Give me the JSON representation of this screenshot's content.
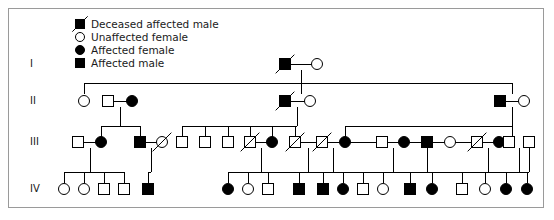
{
  "figure": {
    "kind": "pedigree-chart",
    "width": 554,
    "height": 220,
    "border_color": "#9a9a9a",
    "background_color": "#ffffff",
    "line_color": "#000000",
    "symbol_fill_affected": "#000000",
    "symbol_fill_unaffected": "#ffffff",
    "symbol_stroke": "#000000"
  },
  "legend": {
    "items": [
      {
        "label": "Deceased affected male",
        "shape": "square",
        "affected": true,
        "deceased": true
      },
      {
        "label": "Unaffected female",
        "shape": "circle",
        "affected": false,
        "deceased": false
      },
      {
        "label": "Affected female",
        "shape": "circle",
        "affected": true,
        "deceased": false
      },
      {
        "label": "Affected male",
        "shape": "square",
        "affected": true,
        "deceased": false
      }
    ]
  },
  "generations": [
    {
      "id": "I",
      "label": "I",
      "y": 64
    },
    {
      "id": "II",
      "label": "II",
      "y": 101
    },
    {
      "id": "III",
      "label": "III",
      "y": 142
    },
    {
      "id": "IV",
      "label": "IV",
      "y": 189
    }
  ],
  "individuals": [
    {
      "id": "I-1",
      "gen": "I",
      "x": 285,
      "y": 64,
      "shape": "square",
      "affected": true,
      "deceased": true
    },
    {
      "id": "I-2",
      "gen": "I",
      "x": 317,
      "y": 64,
      "shape": "circle",
      "affected": false,
      "deceased": false
    },
    {
      "id": "II-1",
      "gen": "II",
      "x": 84,
      "y": 101,
      "shape": "circle",
      "affected": false,
      "deceased": false
    },
    {
      "id": "II-2",
      "gen": "II",
      "x": 108,
      "y": 101,
      "shape": "square",
      "affected": false,
      "deceased": false
    },
    {
      "id": "II-3",
      "gen": "II",
      "x": 132,
      "y": 101,
      "shape": "circle",
      "affected": true,
      "deceased": false
    },
    {
      "id": "II-4",
      "gen": "II",
      "x": 285,
      "y": 101,
      "shape": "square",
      "affected": true,
      "deceased": true
    },
    {
      "id": "II-5",
      "gen": "II",
      "x": 310,
      "y": 101,
      "shape": "circle",
      "affected": false,
      "deceased": false
    },
    {
      "id": "II-6",
      "gen": "II",
      "x": 500,
      "y": 101,
      "shape": "square",
      "affected": true,
      "deceased": false
    },
    {
      "id": "II-7",
      "gen": "II",
      "x": 524,
      "y": 101,
      "shape": "circle",
      "affected": false,
      "deceased": false
    },
    {
      "id": "III-1",
      "gen": "III",
      "x": 78,
      "y": 142,
      "shape": "square",
      "affected": false,
      "deceased": false
    },
    {
      "id": "III-2",
      "gen": "III",
      "x": 101,
      "y": 142,
      "shape": "circle",
      "affected": true,
      "deceased": false
    },
    {
      "id": "III-3",
      "gen": "III",
      "x": 140,
      "y": 142,
      "shape": "square",
      "affected": true,
      "deceased": false
    },
    {
      "id": "III-4",
      "gen": "III",
      "x": 162,
      "y": 142,
      "shape": "circle",
      "affected": false,
      "deceased": true
    },
    {
      "id": "III-5",
      "gen": "III",
      "x": 182,
      "y": 142,
      "shape": "square",
      "affected": false,
      "deceased": false
    },
    {
      "id": "III-6",
      "gen": "III",
      "x": 205,
      "y": 142,
      "shape": "square",
      "affected": false,
      "deceased": false
    },
    {
      "id": "III-7",
      "gen": "III",
      "x": 228,
      "y": 142,
      "shape": "square",
      "affected": false,
      "deceased": false
    },
    {
      "id": "III-8",
      "gen": "III",
      "x": 250,
      "y": 142,
      "shape": "square",
      "affected": false,
      "deceased": true
    },
    {
      "id": "III-9",
      "gen": "III",
      "x": 272,
      "y": 142,
      "shape": "circle",
      "affected": true,
      "deceased": false
    },
    {
      "id": "III-10",
      "gen": "III",
      "x": 295,
      "y": 142,
      "shape": "square",
      "affected": false,
      "deceased": true
    },
    {
      "id": "III-11",
      "gen": "III",
      "x": 322,
      "y": 142,
      "shape": "square",
      "affected": false,
      "deceased": true
    },
    {
      "id": "III-12",
      "gen": "III",
      "x": 345,
      "y": 142,
      "shape": "circle",
      "affected": true,
      "deceased": false
    },
    {
      "id": "III-13",
      "gen": "III",
      "x": 382,
      "y": 142,
      "shape": "square",
      "affected": false,
      "deceased": false
    },
    {
      "id": "III-14",
      "gen": "III",
      "x": 404,
      "y": 142,
      "shape": "circle",
      "affected": true,
      "deceased": false
    },
    {
      "id": "III-15",
      "gen": "III",
      "x": 427,
      "y": 142,
      "shape": "square",
      "affected": true,
      "deceased": false
    },
    {
      "id": "III-16",
      "gen": "III",
      "x": 450,
      "y": 142,
      "shape": "circle",
      "affected": false,
      "deceased": false
    },
    {
      "id": "III-17",
      "gen": "III",
      "x": 477,
      "y": 142,
      "shape": "square",
      "affected": false,
      "deceased": true
    },
    {
      "id": "III-18",
      "gen": "III",
      "x": 499,
      "y": 142,
      "shape": "circle",
      "affected": true,
      "deceased": false
    },
    {
      "id": "III-19",
      "gen": "III",
      "x": 509,
      "y": 142,
      "shape": "square",
      "affected": false,
      "deceased": false
    },
    {
      "id": "III-20",
      "gen": "III",
      "x": 529,
      "y": 142,
      "shape": "square",
      "affected": false,
      "deceased": false
    },
    {
      "id": "IV-1",
      "gen": "IV",
      "x": 64,
      "y": 189,
      "shape": "circle",
      "affected": false,
      "deceased": false
    },
    {
      "id": "IV-2",
      "gen": "IV",
      "x": 84,
      "y": 189,
      "shape": "circle",
      "affected": false,
      "deceased": false
    },
    {
      "id": "IV-3",
      "gen": "IV",
      "x": 104,
      "y": 189,
      "shape": "square",
      "affected": false,
      "deceased": false
    },
    {
      "id": "IV-4",
      "gen": "IV",
      "x": 124,
      "y": 189,
      "shape": "square",
      "affected": false,
      "deceased": false
    },
    {
      "id": "IV-5",
      "gen": "IV",
      "x": 148,
      "y": 189,
      "shape": "square",
      "affected": true,
      "deceased": false
    },
    {
      "id": "IV-6",
      "gen": "IV",
      "x": 228,
      "y": 189,
      "shape": "circle",
      "affected": true,
      "deceased": false
    },
    {
      "id": "IV-7",
      "gen": "IV",
      "x": 248,
      "y": 189,
      "shape": "circle",
      "affected": false,
      "deceased": false
    },
    {
      "id": "IV-8",
      "gen": "IV",
      "x": 268,
      "y": 189,
      "shape": "square",
      "affected": false,
      "deceased": false
    },
    {
      "id": "IV-9",
      "gen": "IV",
      "x": 299,
      "y": 189,
      "shape": "square",
      "affected": true,
      "deceased": false
    },
    {
      "id": "IV-10",
      "gen": "IV",
      "x": 323,
      "y": 189,
      "shape": "square",
      "affected": true,
      "deceased": false
    },
    {
      "id": "IV-11",
      "gen": "IV",
      "x": 343,
      "y": 189,
      "shape": "circle",
      "affected": true,
      "deceased": false
    },
    {
      "id": "IV-12",
      "gen": "IV",
      "x": 363,
      "y": 189,
      "shape": "square",
      "affected": false,
      "deceased": false
    },
    {
      "id": "IV-13",
      "gen": "IV",
      "x": 383,
      "y": 189,
      "shape": "circle",
      "affected": false,
      "deceased": false
    },
    {
      "id": "IV-14",
      "gen": "IV",
      "x": 410,
      "y": 189,
      "shape": "square",
      "affected": true,
      "deceased": false
    },
    {
      "id": "IV-15",
      "gen": "IV",
      "x": 432,
      "y": 189,
      "shape": "circle",
      "affected": true,
      "deceased": false
    },
    {
      "id": "IV-16",
      "gen": "IV",
      "x": 462,
      "y": 189,
      "shape": "square",
      "affected": false,
      "deceased": false
    },
    {
      "id": "IV-17",
      "gen": "IV",
      "x": 485,
      "y": 189,
      "shape": "circle",
      "affected": false,
      "deceased": false
    },
    {
      "id": "IV-18",
      "gen": "IV",
      "x": 506,
      "y": 189,
      "shape": "circle",
      "affected": true,
      "deceased": false
    },
    {
      "id": "IV-19",
      "gen": "IV",
      "x": 527,
      "y": 189,
      "shape": "circle",
      "affected": true,
      "deceased": false
    }
  ],
  "mating_lines": [
    {
      "x1": 285,
      "x2": 317,
      "y": 64
    },
    {
      "x1": 108,
      "x2": 132,
      "y": 101
    },
    {
      "x1": 285,
      "x2": 310,
      "y": 101
    },
    {
      "x1": 500,
      "x2": 524,
      "y": 101
    },
    {
      "x1": 78,
      "x2": 101,
      "y": 142
    },
    {
      "x1": 140,
      "x2": 162,
      "y": 142
    },
    {
      "x1": 250,
      "x2": 272,
      "y": 142
    },
    {
      "x1": 295,
      "x2": 322,
      "y": 142
    },
    {
      "x1": 322,
      "x2": 345,
      "y": 142
    },
    {
      "x1": 382,
      "x2": 404,
      "y": 142
    },
    {
      "x1": 427,
      "x2": 450,
      "y": 142
    },
    {
      "x1": 477,
      "x2": 499,
      "y": 142
    },
    {
      "x1": 345,
      "x2": 509,
      "y": 142
    }
  ],
  "descent_lines": [
    {
      "from_x": 301,
      "from_y": 70,
      "bar_y": 83,
      "to_xs": [
        84,
        301,
        512
      ]
    },
    {
      "from_x": 120,
      "from_y": 107,
      "bar_y": 126,
      "to_xs": [
        101,
        140
      ]
    },
    {
      "from_x": 297,
      "from_y": 107,
      "bar_y": 126,
      "to_xs": [
        182,
        205,
        228,
        250,
        272,
        295
      ]
    },
    {
      "from_x": 512,
      "from_y": 107,
      "bar_y": 126,
      "to_xs": [
        345,
        512
      ]
    },
    {
      "from_x": 90,
      "from_y": 148,
      "bar_y": 172,
      "to_xs": [
        64,
        84,
        104,
        124
      ]
    },
    {
      "from_x": 151,
      "from_y": 148,
      "bar_y": 172,
      "to_xs": [
        148
      ]
    },
    {
      "from_x": 261,
      "from_y": 148,
      "bar_y": 172,
      "to_xs": [
        228
      ]
    },
    {
      "from_x": 308,
      "from_y": 148,
      "bar_y": 172,
      "to_xs": [
        248
      ]
    },
    {
      "from_x": 333,
      "from_y": 148,
      "bar_y": 172,
      "to_xs": [
        268
      ]
    },
    {
      "from_x": 393,
      "from_y": 148,
      "bar_y": 172,
      "to_xs": [
        299
      ]
    },
    {
      "from_x": 427,
      "from_y": 148,
      "bar_y": 172,
      "to_xs": [
        323,
        343,
        363,
        383
      ]
    },
    {
      "from_x": 488,
      "from_y": 148,
      "bar_y": 172,
      "to_xs": [
        410,
        432
      ]
    },
    {
      "from_x": 519,
      "from_y": 148,
      "bar_y": 172,
      "to_xs": [
        462
      ]
    },
    {
      "from_x": 529,
      "from_y": 148,
      "bar_y": 172,
      "to_xs": [
        485,
        506,
        527
      ]
    }
  ]
}
